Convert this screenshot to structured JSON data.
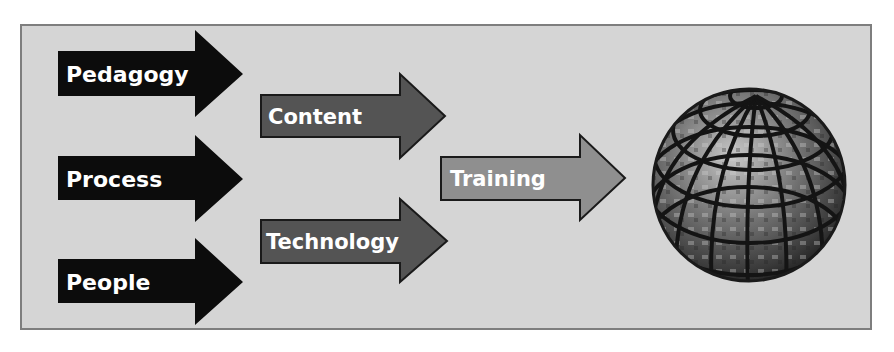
{
  "diagram": {
    "inputs": [
      {
        "label": "Pedagogy"
      },
      {
        "label": "Process"
      },
      {
        "label": "People"
      }
    ],
    "intermediate": [
      {
        "label": "Content"
      },
      {
        "label": "Technology"
      }
    ],
    "output": {
      "label": "Training"
    },
    "destination": {
      "icon": "globe-icon"
    },
    "colors": {
      "background": "#d5d5d5",
      "frame_border": "#7e7e7e",
      "input_arrow_fill": "#0c0c0c",
      "intermediate_arrow_fill": "#545454",
      "output_arrow_fill": "#8f8f8f",
      "label_text": "#ffffff"
    }
  }
}
